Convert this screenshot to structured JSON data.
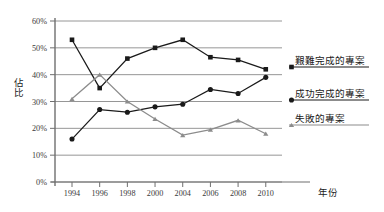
{
  "chart_data": {
    "type": "line",
    "title": "",
    "subtitle": "",
    "xlabel": "年份",
    "ylabel": "佔比",
    "categories": [
      "1994",
      "1996",
      "1998",
      "2000",
      "2004",
      "2006",
      "2008",
      "2010"
    ],
    "x_tick_labels": [
      "1994",
      "1996",
      "1998",
      "2000",
      "2004",
      "2006",
      "2008",
      "2010"
    ],
    "y_tick_labels": [
      "0%",
      "10%",
      "20%",
      "30%",
      "40%",
      "50%",
      "60%"
    ],
    "y_tick_values": [
      0,
      10,
      20,
      30,
      40,
      50,
      60
    ],
    "ylim": [
      0,
      60
    ],
    "grid": true,
    "grid_axis": "y",
    "legend_position": "right",
    "series": [
      {
        "name": "艱難完成的專案",
        "marker": "square",
        "color": "#1a1a1a",
        "line_color": "#1a1a1a",
        "values": [
          53,
          35,
          46,
          50,
          53,
          46.5,
          45.5,
          42
        ]
      },
      {
        "name": "成功完成的專案",
        "marker": "circle",
        "color": "#1a1a1a",
        "line_color": "#1a1a1a",
        "values": [
          16,
          27,
          26,
          28,
          29,
          34.5,
          33,
          39
        ]
      },
      {
        "name": "失敗的專案",
        "marker": "triangle",
        "color": "#8c8c8c",
        "line_color": "#8c8c8c",
        "values": [
          31,
          40,
          30,
          23.5,
          17.5,
          19.5,
          23,
          18
        ]
      }
    ]
  },
  "legend": {
    "entries": [
      {
        "label": "艱難完成的專案",
        "marker": "square",
        "color": "#1a1a1a"
      },
      {
        "label": "成功完成的專案",
        "marker": "circle",
        "color": "#1a1a1a"
      },
      {
        "label": "失敗的專案",
        "marker": "triangle",
        "color": "#8c8c8c"
      }
    ]
  },
  "axes": {
    "x_title": "年份",
    "y_title": "佔比",
    "axis_color": "#6f6f6f",
    "grid_color": "#8a8a8a"
  }
}
